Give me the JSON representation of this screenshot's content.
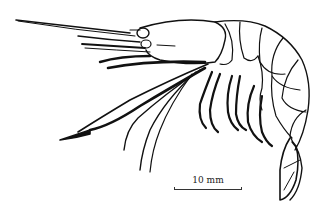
{
  "figure": {
    "ink_color": "#111111",
    "background": "#ffffff"
  },
  "scale_bar": {
    "label": "10 mm"
  }
}
